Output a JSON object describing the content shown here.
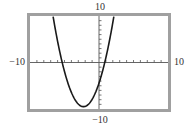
{
  "chart_data": {
    "type": "line",
    "title": "",
    "xlabel": "",
    "ylabel": "",
    "xlim": [
      -10,
      10
    ],
    "ylim": [
      -10,
      10
    ],
    "xscale_tick": 1,
    "yscale_tick": 1,
    "grid": false,
    "legend": null,
    "window_labels": {
      "xmin": "−10",
      "xmax": "10",
      "ymin": "−10",
      "ymax": "10"
    },
    "series": [
      {
        "name": "parabola",
        "equation": "y = (x + 2.25)^2 - 9.5",
        "vertex": [
          -2.25,
          -9.5
        ],
        "x_intercepts": [
          -5.33,
          0.83
        ],
        "y_intercept": -4.44,
        "color": "#1a1a1a"
      }
    ]
  },
  "style": {
    "frame_color": "#9a9a9a",
    "axis_color": "#555555",
    "curve_color": "#1a1a1a"
  }
}
